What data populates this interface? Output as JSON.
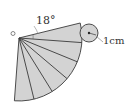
{
  "diagram": {
    "type": "cone-net",
    "apex_label": "O",
    "angle_label": "18°",
    "radius_label": "1cm",
    "wedge_count": 6,
    "wedge_angle_deg": 18,
    "total_angle_deg": 108,
    "colors": {
      "fill": "#d3d3d3",
      "stroke": "#3a3a3a",
      "text": "#333333",
      "background": "#ffffff"
    }
  }
}
